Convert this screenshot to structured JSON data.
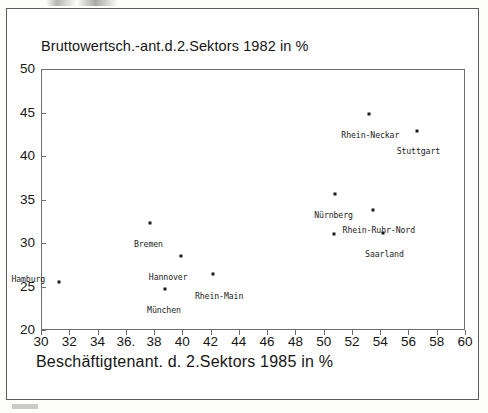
{
  "chart_data": {
    "type": "scatter",
    "title": "Bruttowertsch.-ant.d.2.Sektors 1982 in %",
    "xlabel": "Beschäftigtenant. d. 2.Sektors 1985 in %",
    "ylabel": "Bruttowertsch.-ant.d.2.Sektors 1982 in %",
    "xlim": [
      30,
      60
    ],
    "ylim": [
      20,
      50
    ],
    "xticks": [
      30,
      32,
      34,
      36,
      38,
      40,
      42,
      44,
      46,
      48,
      50,
      52,
      54,
      56,
      58,
      60
    ],
    "yticks": [
      20,
      25,
      30,
      35,
      40,
      45,
      50
    ],
    "xticklabels": [
      "30",
      "32",
      "34",
      "36.",
      "38",
      "40",
      "42",
      "44",
      "46",
      "48",
      "50",
      "52",
      "54",
      "56",
      "58",
      "60"
    ],
    "yticklabels": [
      "20",
      "25",
      "30",
      "35",
      "40",
      "45",
      "50"
    ],
    "grid": false,
    "legend": null,
    "points": [
      {
        "label": "Hamburg",
        "x": 31.3,
        "y": 25.5,
        "label_dx": -2.2,
        "label_dy": 1.4
      },
      {
        "label": "Bremen",
        "x": 37.7,
        "y": 32.3,
        "label_dx": -0.1,
        "label_dy": -1.4
      },
      {
        "label": "München",
        "x": 38.8,
        "y": 24.7,
        "label_dx": -0.1,
        "label_dy": -1.4
      },
      {
        "label": "Hannover",
        "x": 39.9,
        "y": 28.5,
        "label_dx": -0.9,
        "label_dy": -1.4
      },
      {
        "label": "Rhein-Main",
        "x": 42.2,
        "y": 26.4,
        "label_dx": 0.4,
        "label_dy": -1.4
      },
      {
        "label": "",
        "x": 50.7,
        "y": 31.0,
        "label_dx": 0,
        "label_dy": 0
      },
      {
        "label": "Nürnberg",
        "x": 50.8,
        "y": 35.6,
        "label_dx": -0.1,
        "label_dy": -1.3
      },
      {
        "label": "Rhein-Neckar",
        "x": 53.2,
        "y": 44.8,
        "label_dx": 0.1,
        "label_dy": -1.3
      },
      {
        "label": "Rhein-Ruhr-Nord",
        "x": 53.5,
        "y": 33.8,
        "label_dx": 0.4,
        "label_dy": -1.3
      },
      {
        "label": "Saarland",
        "x": 54.2,
        "y": 31.1,
        "label_dx": 0.1,
        "label_dy": -1.3
      },
      {
        "label": "Stuttgart",
        "x": 56.6,
        "y": 42.9,
        "label_dx": 0.1,
        "label_dy": -1.3
      }
    ]
  },
  "colors": {
    "ink": "#1b1b1b",
    "frame": "#6e6e6e",
    "page_border": "#5c5c5c",
    "background": "#ffffff"
  }
}
